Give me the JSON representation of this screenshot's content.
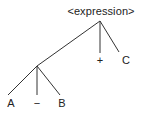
{
  "tree": {
    "root": {
      "label": "<expression>",
      "x": 101,
      "y": 8
    },
    "nodes": [
      {
        "id": "plus",
        "label": "+",
        "x": 100,
        "y": 55
      },
      {
        "id": "c",
        "label": "C",
        "x": 126,
        "y": 55
      },
      {
        "id": "a",
        "label": "A",
        "x": 11,
        "y": 98
      },
      {
        "id": "minus",
        "label": "−",
        "x": 37,
        "y": 98
      },
      {
        "id": "b",
        "label": "B",
        "x": 62,
        "y": 98
      }
    ],
    "edges": [
      {
        "from": "root",
        "to": "plus"
      },
      {
        "from": "root",
        "to": "c"
      },
      {
        "from": "root",
        "to": "sub"
      },
      {
        "from": "sub",
        "to": "a"
      },
      {
        "from": "sub",
        "to": "minus"
      },
      {
        "from": "sub",
        "to": "b"
      }
    ]
  },
  "colors": {
    "line": "#333333",
    "text": "#222222"
  }
}
